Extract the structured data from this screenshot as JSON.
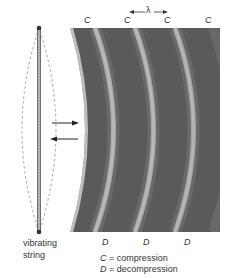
{
  "figure": {
    "type": "sound-wave-from-vibrating-string",
    "colors": {
      "band_dark": "#575757",
      "band_light": "#cfcfcf",
      "string": "#555555",
      "background": "#ffffff"
    },
    "top_labels": [
      "C",
      "C",
      "C",
      "C"
    ],
    "bottom_labels": [
      "D",
      "D",
      "D"
    ],
    "wavelength_symbol": "λ",
    "source_label_line1": "vibrating",
    "source_label_line2": "string",
    "legend": [
      {
        "symbol": "C",
        "text": " = compression"
      },
      {
        "symbol": "D",
        "text": " = decompression"
      }
    ],
    "motion_arrows": [
      "right-arrow",
      "left-arrow"
    ]
  }
}
